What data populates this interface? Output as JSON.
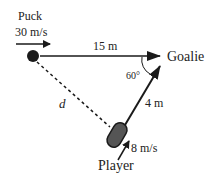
{
  "diagram": {
    "labels": {
      "puck": "Puck",
      "puck_speed": "30 m/s",
      "distance_puck_goalie": "15 m",
      "goalie": "Goalie",
      "angle": "60°",
      "distance_player_goalie": "4 m",
      "unknown_distance": "d",
      "player_speed": "8 m/s",
      "player": "Player"
    },
    "colors": {
      "ink": "#1a1a1a",
      "player_fill": "#555555"
    }
  }
}
